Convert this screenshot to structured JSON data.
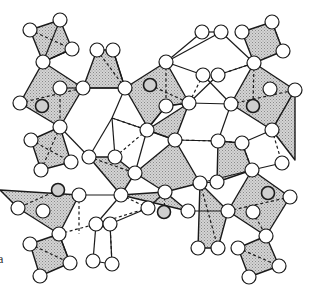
{
  "figure": {
    "kind": "crystal-structure-projection",
    "axis_label": "a",
    "colors": {
      "polyhedron_fill": "#c8c8c8",
      "line": "#1a1a1a",
      "atom_fill": "#ffffff",
      "inner_atom_fill": "#cfcfcf"
    }
  },
  "atoms": [
    [
      30,
      30
    ],
    [
      60,
      20
    ],
    [
      72,
      49
    ],
    [
      43,
      62
    ],
    [
      60,
      88
    ],
    [
      83,
      88
    ],
    [
      20,
      103
    ],
    [
      60,
      127
    ],
    [
      97,
      50
    ],
    [
      113,
      50
    ],
    [
      125,
      88
    ],
    [
      166,
      62
    ],
    [
      166,
      106
    ],
    [
      189,
      103
    ],
    [
      203,
      75
    ],
    [
      218,
      75
    ],
    [
      202,
      32
    ],
    [
      221,
      32
    ],
    [
      242,
      32
    ],
    [
      272,
      22
    ],
    [
      283,
      51
    ],
    [
      254,
      63
    ],
    [
      270,
      89
    ],
    [
      295,
      90
    ],
    [
      231,
      104
    ],
    [
      272,
      130
    ],
    [
      242,
      143
    ],
    [
      218,
      141
    ],
    [
      282,
      163
    ],
    [
      252,
      170
    ],
    [
      31,
      140
    ],
    [
      71,
      162
    ],
    [
      41,
      170
    ],
    [
      89,
      157
    ],
    [
      115,
      157
    ],
    [
      135,
      173
    ],
    [
      147,
      130
    ],
    [
      175,
      140
    ],
    [
      79,
      195
    ],
    [
      121,
      195
    ],
    [
      18,
      208
    ],
    [
      43,
      211
    ],
    [
      165,
      192
    ],
    [
      148,
      208
    ],
    [
      188,
      211
    ],
    [
      200,
      183
    ],
    [
      217,
      182
    ],
    [
      96,
      224
    ],
    [
      110,
      224
    ],
    [
      59,
      234
    ],
    [
      30,
      244
    ],
    [
      70,
      263
    ],
    [
      40,
      276
    ],
    [
      93,
      261
    ],
    [
      112,
      264
    ],
    [
      290,
      197
    ],
    [
      228,
      211
    ],
    [
      253,
      212
    ],
    [
      266,
      236
    ],
    [
      238,
      248
    ],
    [
      279,
      266
    ],
    [
      249,
      277
    ],
    [
      198,
      248
    ],
    [
      218,
      248
    ]
  ],
  "inner_atoms": [
    [
      42,
      106
    ],
    [
      150,
      85
    ],
    [
      253,
      106
    ],
    [
      58,
      190
    ],
    [
      164,
      212
    ],
    [
      268,
      193
    ]
  ],
  "polyhedra": [
    [
      [
        30,
        30
      ],
      [
        60,
        20
      ],
      [
        72,
        49
      ],
      [
        43,
        62
      ]
    ],
    [
      [
        43,
        62
      ],
      [
        83,
        88
      ],
      [
        60,
        127
      ],
      [
        20,
        103
      ]
    ],
    [
      [
        97,
        50
      ],
      [
        113,
        50
      ],
      [
        125,
        88
      ],
      [
        83,
        88
      ]
    ],
    [
      [
        125,
        88
      ],
      [
        166,
        62
      ],
      [
        189,
        103
      ],
      [
        166,
        106
      ],
      [
        148,
        128
      ]
    ],
    [
      [
        242,
        32
      ],
      [
        272,
        22
      ],
      [
        283,
        51
      ],
      [
        254,
        63
      ]
    ],
    [
      [
        254,
        63
      ],
      [
        295,
        90
      ],
      [
        272,
        130
      ],
      [
        231,
        104
      ]
    ],
    [
      [
        31,
        140
      ],
      [
        60,
        127
      ],
      [
        71,
        162
      ],
      [
        41,
        170
      ]
    ],
    [
      [
        89,
        157
      ],
      [
        115,
        157
      ],
      [
        135,
        173
      ],
      [
        121,
        195
      ]
    ],
    [
      [
        0,
        190
      ],
      [
        79,
        195
      ],
      [
        59,
        234
      ],
      [
        18,
        208
      ]
    ],
    [
      [
        135,
        173
      ],
      [
        175,
        140
      ],
      [
        200,
        183
      ],
      [
        165,
        192
      ]
    ],
    [
      [
        218,
        141
      ],
      [
        242,
        143
      ],
      [
        252,
        170
      ],
      [
        217,
        182
      ]
    ],
    [
      [
        147,
        130
      ],
      [
        175,
        140
      ],
      [
        189,
        103
      ]
    ],
    [
      [
        121,
        195
      ],
      [
        188,
        211
      ],
      [
        165,
        192
      ]
    ],
    [
      [
        30,
        244
      ],
      [
        59,
        234
      ],
      [
        70,
        263
      ],
      [
        40,
        276
      ]
    ],
    [
      [
        200,
        183
      ],
      [
        228,
        211
      ],
      [
        218,
        248
      ],
      [
        198,
        248
      ]
    ],
    [
      [
        252,
        170
      ],
      [
        290,
        197
      ],
      [
        266,
        236
      ],
      [
        228,
        211
      ]
    ],
    [
      [
        238,
        248
      ],
      [
        266,
        236
      ],
      [
        279,
        266
      ],
      [
        249,
        277
      ]
    ],
    [
      [
        272,
        130
      ],
      [
        295,
        90
      ],
      [
        295,
        160
      ]
    ]
  ],
  "bonds_solid": [
    [
      [
        43,
        62
      ],
      [
        72,
        49
      ]
    ],
    [
      [
        60,
        20
      ],
      [
        43,
        62
      ]
    ],
    [
      [
        83,
        88
      ],
      [
        125,
        88
      ]
    ],
    [
      [
        125,
        88
      ],
      [
        113,
        50
      ]
    ],
    [
      [
        202,
        32
      ],
      [
        221,
        32
      ]
    ],
    [
      [
        221,
        32
      ],
      [
        166,
        62
      ]
    ],
    [
      [
        202,
        32
      ],
      [
        166,
        62
      ]
    ],
    [
      [
        221,
        32
      ],
      [
        254,
        63
      ]
    ],
    [
      [
        166,
        62
      ],
      [
        203,
        75
      ]
    ],
    [
      [
        203,
        75
      ],
      [
        231,
        104
      ]
    ],
    [
      [
        189,
        103
      ],
      [
        218,
        75
      ]
    ],
    [
      [
        218,
        75
      ],
      [
        254,
        63
      ]
    ],
    [
      [
        125,
        88
      ],
      [
        112,
        118
      ]
    ],
    [
      [
        112,
        118
      ],
      [
        89,
        157
      ]
    ],
    [
      [
        112,
        118
      ],
      [
        147,
        130
      ]
    ],
    [
      [
        147,
        130
      ],
      [
        166,
        106
      ]
    ],
    [
      [
        166,
        106
      ],
      [
        189,
        103
      ]
    ],
    [
      [
        147,
        130
      ],
      [
        175,
        140
      ]
    ],
    [
      [
        189,
        103
      ],
      [
        231,
        104
      ]
    ],
    [
      [
        175,
        140
      ],
      [
        218,
        141
      ]
    ],
    [
      [
        218,
        141
      ],
      [
        231,
        104
      ]
    ],
    [
      [
        135,
        173
      ],
      [
        147,
        130
      ]
    ],
    [
      [
        60,
        127
      ],
      [
        89,
        157
      ]
    ],
    [
      [
        115,
        157
      ],
      [
        112,
        118
      ]
    ],
    [
      [
        242,
        143
      ],
      [
        272,
        130
      ]
    ],
    [
      [
        252,
        170
      ],
      [
        282,
        163
      ]
    ],
    [
      [
        200,
        183
      ],
      [
        252,
        170
      ]
    ],
    [
      [
        217,
        182
      ],
      [
        200,
        183
      ]
    ],
    [
      [
        79,
        195
      ],
      [
        121,
        195
      ]
    ],
    [
      [
        121,
        195
      ],
      [
        96,
        224
      ]
    ],
    [
      [
        110,
        224
      ],
      [
        148,
        208
      ]
    ],
    [
      [
        59,
        234
      ],
      [
        70,
        263
      ]
    ],
    [
      [
        96,
        224
      ],
      [
        93,
        261
      ]
    ],
    [
      [
        93,
        261
      ],
      [
        112,
        264
      ]
    ],
    [
      [
        112,
        264
      ],
      [
        110,
        224
      ]
    ],
    [
      [
        148,
        208
      ],
      [
        165,
        192
      ]
    ],
    [
      [
        188,
        211
      ],
      [
        228,
        211
      ]
    ],
    [
      [
        60,
        88
      ],
      [
        83,
        88
      ]
    ]
  ],
  "bonds_dashed": [
    [
      [
        43,
        62
      ],
      [
        72,
        49
      ]
    ],
    [
      [
        30,
        30
      ],
      [
        72,
        49
      ]
    ],
    [
      [
        60,
        88
      ],
      [
        60,
        127
      ]
    ],
    [
      [
        20,
        103
      ],
      [
        83,
        88
      ]
    ],
    [
      [
        97,
        50
      ],
      [
        125,
        88
      ]
    ],
    [
      [
        166,
        62
      ],
      [
        166,
        106
      ]
    ],
    [
      [
        150,
        85
      ],
      [
        189,
        103
      ]
    ],
    [
      [
        203,
        75
      ],
      [
        189,
        103
      ]
    ],
    [
      [
        218,
        75
      ],
      [
        254,
        63
      ]
    ],
    [
      [
        254,
        63
      ],
      [
        253,
        106
      ]
    ],
    [
      [
        231,
        104
      ],
      [
        295,
        90
      ]
    ],
    [
      [
        272,
        22
      ],
      [
        283,
        51
      ]
    ],
    [
      [
        112,
        118
      ],
      [
        147,
        130
      ]
    ],
    [
      [
        147,
        130
      ],
      [
        115,
        157
      ]
    ],
    [
      [
        31,
        140
      ],
      [
        71,
        162
      ]
    ],
    [
      [
        60,
        127
      ],
      [
        41,
        170
      ]
    ],
    [
      [
        89,
        157
      ],
      [
        135,
        173
      ]
    ],
    [
      [
        58,
        190
      ],
      [
        18,
        208
      ]
    ],
    [
      [
        79,
        195
      ],
      [
        79,
        234
      ]
    ],
    [
      [
        165,
        192
      ],
      [
        164,
        212
      ]
    ],
    [
      [
        121,
        195
      ],
      [
        148,
        208
      ]
    ],
    [
      [
        59,
        234
      ],
      [
        96,
        224
      ]
    ],
    [
      [
        110,
        224
      ],
      [
        112,
        264
      ]
    ],
    [
      [
        148,
        208
      ],
      [
        96,
        224
      ]
    ],
    [
      [
        242,
        143
      ],
      [
        252,
        170
      ]
    ],
    [
      [
        272,
        130
      ],
      [
        282,
        163
      ]
    ],
    [
      [
        228,
        211
      ],
      [
        290,
        197
      ]
    ],
    [
      [
        253,
        212
      ],
      [
        266,
        236
      ]
    ],
    [
      [
        238,
        248
      ],
      [
        279,
        266
      ]
    ],
    [
      [
        200,
        183
      ],
      [
        218,
        248
      ]
    ],
    [
      [
        30,
        244
      ],
      [
        70,
        263
      ]
    ],
    [
      [
        218,
        141
      ],
      [
        242,
        143
      ]
    ],
    [
      [
        175,
        140
      ],
      [
        218,
        141
      ]
    ]
  ]
}
